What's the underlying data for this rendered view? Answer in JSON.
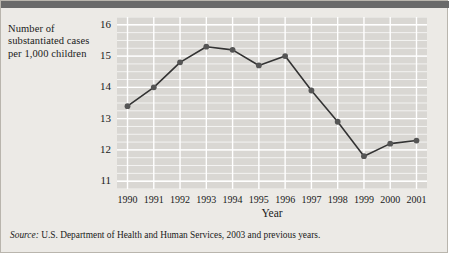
{
  "figure": {
    "y_axis_caption": "Number of substantiated cases per 1,000 children",
    "source_label": "Source:",
    "source_text": "U.S. Department of Health and Human Services, 2003 and previous years."
  },
  "chart_data": {
    "type": "line",
    "title": "",
    "subtitle": "",
    "xlabel": "Year",
    "ylabel": "Number of substantiated cases per 1,000 children",
    "categories": [
      "1990",
      "1991",
      "1992",
      "1993",
      "1994",
      "1995",
      "1996",
      "1997",
      "1998",
      "1999",
      "2000",
      "2001"
    ],
    "x": [
      1990,
      1991,
      1992,
      1993,
      1994,
      1995,
      1996,
      1997,
      1998,
      1999,
      2000,
      2001
    ],
    "values": [
      13.4,
      14.0,
      14.8,
      15.3,
      15.2,
      14.7,
      15.0,
      13.9,
      12.9,
      11.8,
      12.2,
      12.3
    ],
    "series": [
      {
        "name": "Substantiated cases per 1,000 children",
        "values": [
          13.4,
          14.0,
          14.8,
          15.3,
          15.2,
          14.7,
          15.0,
          13.9,
          12.9,
          11.8,
          12.2,
          12.3
        ]
      }
    ],
    "ylim": [
      10.75,
      16.25
    ],
    "yticks": [
      11,
      12,
      13,
      14,
      15,
      16
    ],
    "ytick_labels": [
      "11",
      "12",
      "13",
      "14",
      "15",
      "16"
    ],
    "y_minor_step": 0.25,
    "xlim": [
      1989.6,
      2001.4
    ],
    "grid": true,
    "grid_color": "#ffffff",
    "legend": "none",
    "plot_background": "#d9d7d3",
    "figure_background": "#eceae6",
    "line_color": "#333333",
    "marker_color": "#555555",
    "marker": "circle"
  }
}
